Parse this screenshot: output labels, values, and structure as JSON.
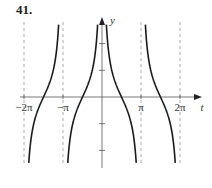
{
  "problem_number": "41.",
  "chart_data": {
    "type": "line",
    "function": "y = cot|t|",
    "title": "",
    "xlabel": "t",
    "ylabel": "y",
    "xlim": [
      -6.8,
      7.0
    ],
    "ylim": [
      -2.6,
      2.7
    ],
    "x_ticks": [
      {
        "value": -6.283185,
        "label": "−2π"
      },
      {
        "value": -3.141593,
        "label": "−π"
      },
      {
        "value": 3.141593,
        "label": "π"
      },
      {
        "value": 6.283185,
        "label": "2π"
      }
    ],
    "y_ticks": [
      -2,
      -1,
      1,
      2
    ],
    "asymptotes": [
      -6.283185,
      -3.141593,
      0,
      3.141593,
      6.283185
    ],
    "dashed_asymptotes": [
      -6.283185,
      -3.141593,
      3.141593,
      6.283185
    ],
    "zeros": [
      -4.712389,
      -1.570796,
      1.570796,
      4.712389
    ],
    "series": [
      {
        "name": "branch-1",
        "domain": [
          -6.283185,
          -3.141593
        ]
      },
      {
        "name": "branch-2",
        "domain": [
          -3.141593,
          0
        ]
      },
      {
        "name": "branch-3",
        "domain": [
          0,
          3.141593
        ]
      },
      {
        "name": "branch-4",
        "domain": [
          3.141593,
          6.283185
        ]
      }
    ],
    "grid": false,
    "legend": "none",
    "colors": {
      "curve": "#1a1a1a",
      "axis": "#555555",
      "asymptote": "#888888"
    }
  }
}
